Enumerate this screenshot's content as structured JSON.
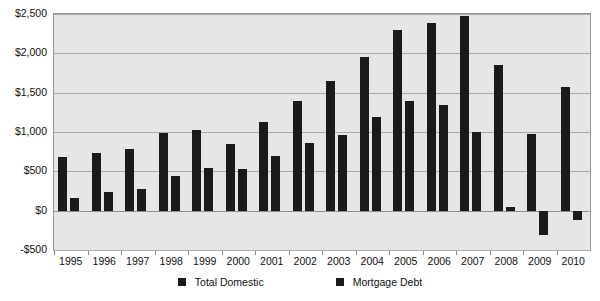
{
  "chart_data": {
    "type": "bar",
    "title": "",
    "subtitle": "",
    "xlabel": "",
    "ylabel": "",
    "ylim": [
      -500,
      2500
    ],
    "ytick_labels": [
      "$2,500",
      "$2,000",
      "$1,500",
      "$1,000",
      "$500",
      "$0",
      "-$500"
    ],
    "ytick_values": [
      2500,
      2000,
      1500,
      1000,
      500,
      0,
      -500
    ],
    "grid": true,
    "legend_position": "bottom",
    "categories": [
      "1995",
      "1996",
      "1997",
      "1998",
      "1999",
      "2000",
      "2001",
      "2002",
      "2003",
      "2004",
      "2005",
      "2006",
      "2007",
      "2008",
      "2009",
      "2010"
    ],
    "series": [
      {
        "name": "Total Domestic",
        "color": "#1a1a1a",
        "values": [
          680,
          730,
          790,
          985,
          1020,
          845,
          1125,
          1395,
          1650,
          1950,
          2300,
          2390,
          2470,
          1855,
          970,
          1570
        ]
      },
      {
        "name": "Mortgage Debt",
        "color": "#1a1a1a",
        "values": [
          160,
          240,
          275,
          440,
          545,
          525,
          690,
          855,
          960,
          1195,
          1390,
          1345,
          1000,
          50,
          -315,
          -120
        ]
      }
    ]
  },
  "legend": {
    "items": [
      {
        "label": "Total Domestic",
        "color": "#1a1a1a"
      },
      {
        "label": "Mortgage Debt",
        "color": "#1a1a1a"
      }
    ]
  },
  "colors": {
    "bar": "#1a1a1a",
    "plot_background": "#e6e6e6",
    "gridline": "#a9a9a9",
    "page_background": "#ffffff",
    "text": "#111111"
  }
}
